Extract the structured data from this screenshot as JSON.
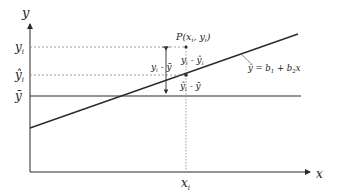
{
  "diagram": {
    "type": "regression-decomposition",
    "axes": {
      "x_label": "x",
      "y_label": "y"
    },
    "ticks": {
      "y_i": "y",
      "y_i_sub": "i",
      "yhat_i": "ŷ",
      "yhat_i_sub": "i",
      "ybar": "ȳ",
      "x_i": "x",
      "x_i_sub": "i"
    },
    "point_label": "P(x̄ , y )",
    "point_label_parts": {
      "prefix": "P(x",
      "sub1": "i",
      "mid": ", y",
      "sub2": "i",
      "suffix": ")"
    },
    "segments": {
      "total": "y - ȳ",
      "total_parts": {
        "a": "y",
        "a_sub": "i",
        "rest": " - ȳ"
      },
      "residual": "y - ŷ",
      "residual_parts": {
        "a": "y",
        "a_sub": "i",
        "rest": " - ŷ",
        "b_sub": "i"
      },
      "explained": "ŷ - ȳ",
      "explained_parts": {
        "a": "ŷ",
        "a_sub": "i",
        "rest": " - ȳ"
      }
    },
    "regression_equation": {
      "text": "ŷ = b1 + b2x",
      "parts": {
        "lhs": "ŷ = b",
        "sub1": "1",
        "mid": " + b",
        "sub2": "2",
        "rhs": "x"
      }
    },
    "colors": {
      "line": "#2b2b2b",
      "dashed": "#888888",
      "text": "#222222",
      "background": "#ffffff"
    }
  }
}
